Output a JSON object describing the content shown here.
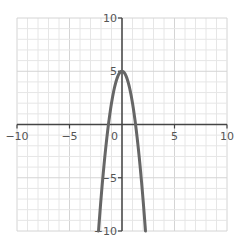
{
  "chart_data": {
    "type": "line",
    "title": "",
    "xlabel": "",
    "ylabel": "",
    "xlim": [
      -10,
      10
    ],
    "ylim": [
      -10,
      10
    ],
    "grid": true,
    "grid_step": 1,
    "x_ticks": [
      -10,
      -5,
      5,
      10
    ],
    "y_ticks": [
      10,
      5,
      -5,
      -10
    ],
    "x_tick_labels": [
      "−10",
      "−5",
      "5",
      "10"
    ],
    "y_tick_labels": [
      "10",
      "5",
      "−5",
      "−10"
    ],
    "origin_label": "0",
    "series": [
      {
        "name": "y = -3x^2 + 5",
        "function": "-3*x*x + 5",
        "color": "#666666",
        "x": [
          -2.24,
          -2,
          -1.5,
          -1.29,
          -1,
          -0.5,
          0,
          0.5,
          1,
          1.29,
          1.5,
          2,
          2.24
        ],
        "y": [
          -10,
          -7,
          -1.75,
          0,
          2,
          4.25,
          5,
          4.25,
          2,
          0,
          -1.75,
          -7,
          -10
        ]
      }
    ]
  },
  "colors": {
    "axis": "#444444",
    "grid_minor": "#e6e6e6",
    "grid_major": "#d4d4d4",
    "curve": "#666666",
    "label": "#555555"
  }
}
